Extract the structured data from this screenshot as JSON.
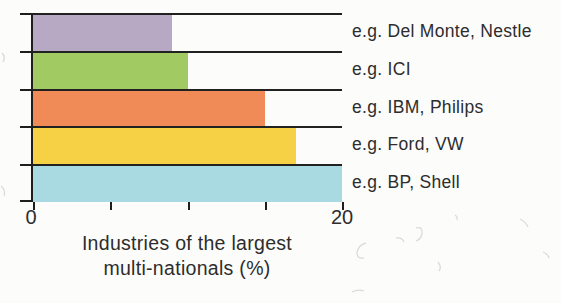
{
  "chart_data": {
    "type": "bar",
    "orientation": "horizontal",
    "title": "",
    "xlabel": "Industries of the largest multi-nationals (%)",
    "xlabel_lines": [
      "Industries of the largest",
      "multi-nationals (%)"
    ],
    "xlim": [
      0,
      20
    ],
    "x_ticks": [
      0,
      5,
      10,
      15,
      20
    ],
    "x_tick_labels": [
      {
        "value": 0,
        "text": "0"
      },
      {
        "value": 20,
        "text": "20"
      }
    ],
    "grid": "row-separators-full-width",
    "legend": "none",
    "bars": [
      {
        "example_label": "e.g. Del Monte, Nestle",
        "value": 9,
        "color": "#b7a9c4"
      },
      {
        "example_label": "e.g. ICI",
        "value": 10,
        "color": "#a2ca63"
      },
      {
        "example_label": "e.g. IBM, Philips",
        "value": 15,
        "color": "#f08a57"
      },
      {
        "example_label": "e.g. Ford, VW",
        "value": 17,
        "color": "#f6d045"
      },
      {
        "example_label": "e.g. BP, Shell",
        "value": 20,
        "color": "#a9d9e1"
      }
    ],
    "colors": {
      "axis": "#1e1e1e",
      "text": "#2d2d2d",
      "background": "#fcfcfb"
    }
  }
}
